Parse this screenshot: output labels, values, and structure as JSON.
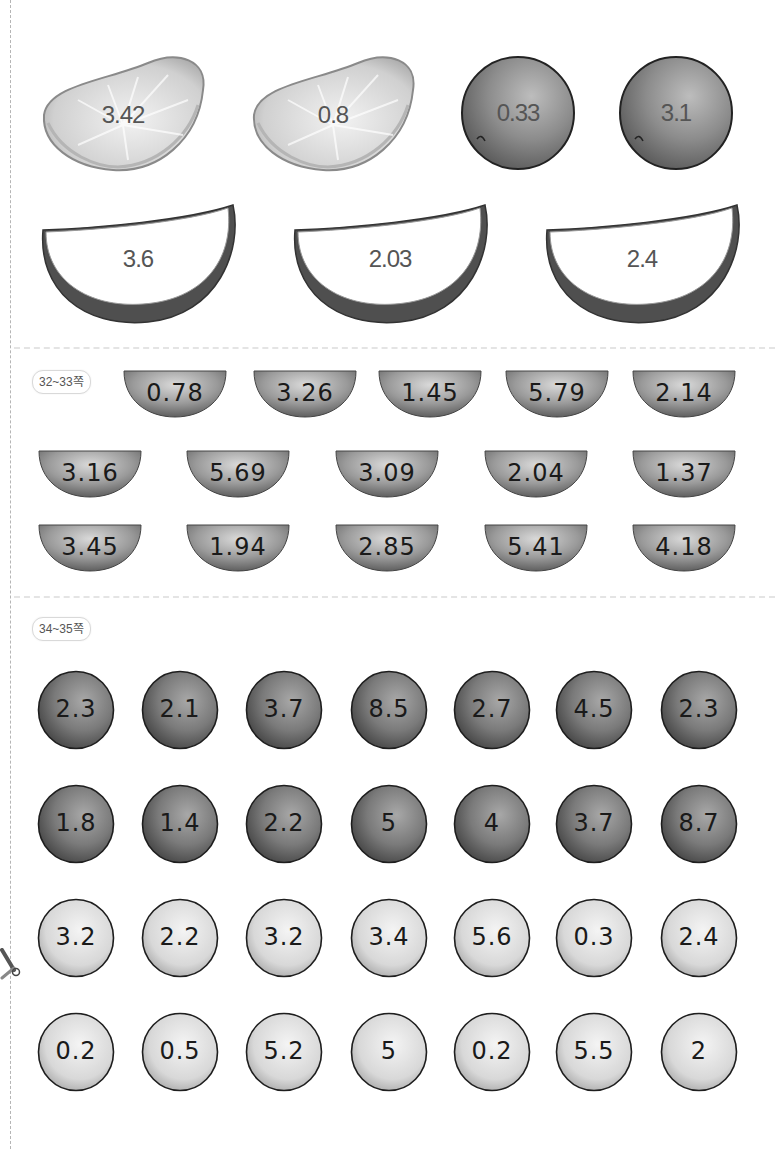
{
  "page_tags": {
    "section_32_33": "32~33쪽",
    "section_34_35": "34~35쪽"
  },
  "icons": {
    "scissors": "scissors-icon"
  },
  "tangerine_segments": [
    "3.42",
    "0.8"
  ],
  "grapes": [
    "0.33",
    "3.1"
  ],
  "watermelon_slices": [
    "3.6",
    "2.03",
    "2.4"
  ],
  "bowls": {
    "row1": [
      "0.78",
      "3.26",
      "1.45",
      "5.79",
      "2.14"
    ],
    "row2": [
      "3.16",
      "5.69",
      "3.09",
      "2.04",
      "1.37"
    ],
    "row3": [
      "3.45",
      "1.94",
      "2.85",
      "5.41",
      "4.18"
    ]
  },
  "dark_balls": {
    "row1": [
      "2.3",
      "2.1",
      "3.7",
      "8.5",
      "2.7",
      "4.5",
      "2.3"
    ],
    "row2": [
      "1.8",
      "1.4",
      "2.2",
      "5",
      "4",
      "3.7",
      "8.7"
    ]
  },
  "light_balls": {
    "row1": [
      "3.2",
      "2.2",
      "3.2",
      "3.4",
      "5.6",
      "0.3",
      "2.4"
    ],
    "row2": [
      "0.2",
      "0.5",
      "5.2",
      "5",
      "0.2",
      "5.5",
      "2"
    ]
  },
  "colors": {
    "dark_ball": "#6e6e6e",
    "light_ball": "#d6d6d6",
    "bowl": "#8a8a8a",
    "watermelon_rind": "#555555",
    "outline": "#2a2a2a"
  }
}
